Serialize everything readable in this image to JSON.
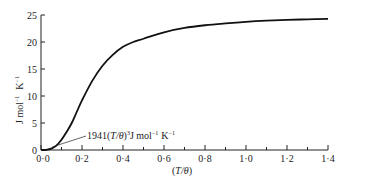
{
  "chart_data": {
    "type": "line",
    "title": "",
    "xlabel": "(T/θ)",
    "ylabel": "J mol⁻¹ K⁻¹",
    "xlim": [
      0,
      1.4
    ],
    "ylim": [
      0,
      25
    ],
    "x_ticks": [
      "0·0",
      "0·2",
      "0·4",
      "0·6",
      "0·8",
      "1·0",
      "1·2",
      "1·4"
    ],
    "x_tick_values": [
      0,
      0.2,
      0.4,
      0.6,
      0.8,
      1.0,
      1.2,
      1.4
    ],
    "y_ticks": [
      "0",
      "5",
      "10",
      "15",
      "20",
      "25"
    ],
    "y_tick_values": [
      0,
      5,
      10,
      15,
      20,
      25
    ],
    "grid": false,
    "series": [
      {
        "name": "Debye heat capacity",
        "x": [
          0,
          0.025,
          0.05,
          0.075,
          0.1,
          0.125,
          0.15,
          0.175,
          0.2,
          0.25,
          0.3,
          0.35,
          0.4,
          0.45,
          0.5,
          0.6,
          0.7,
          0.8,
          0.9,
          1.0,
          1.1,
          1.2,
          1.3,
          1.4
        ],
        "values": [
          0,
          0.03,
          0.24,
          0.82,
          1.89,
          3.35,
          5.0,
          7.1,
          9.19,
          12.8,
          15.6,
          17.6,
          19.1,
          20.0,
          20.6,
          21.8,
          22.6,
          23.1,
          23.45,
          23.74,
          23.95,
          24.1,
          24.2,
          24.3
        ]
      },
      {
        "name": "1941(T/θ)³ J mol⁻¹ K⁻¹",
        "x": [
          0,
          0.02,
          0.04,
          0.06,
          0.08
        ],
        "values": [
          0,
          0.016,
          0.124,
          0.42,
          0.99
        ]
      }
    ],
    "annotations": [
      {
        "text": "1941(T/θ)³J mol⁻¹ K⁻¹",
        "points_to": [
          0.06,
          0.5
        ]
      }
    ]
  },
  "labels": {
    "annotation_prefix": "1941(",
    "annotation_T": "T/θ",
    "annotation_mid": ")",
    "annotation_exp": "3",
    "annotation_suffix": "J mol",
    "annotation_exp2": "−1",
    "annotation_K": "K",
    "annotation_exp3": "−1",
    "y_J": "J mol",
    "y_exp1": "−1",
    "y_K": "K",
    "y_exp2": "−1",
    "x_open": "(",
    "x_T": "T/θ",
    "x_close": ")"
  }
}
